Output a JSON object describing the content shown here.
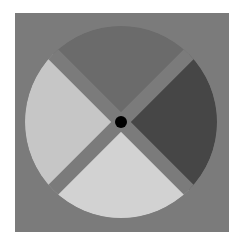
{
  "diagram": {
    "type": "four-quadrant wheel",
    "background_color": "#7b7b7b",
    "center_dot_color": "#000000",
    "sectors": [
      {
        "position": "top",
        "color": "#6b6b6b"
      },
      {
        "position": "right",
        "color": "#464646"
      },
      {
        "position": "bottom",
        "color": "#d2d2d2"
      },
      {
        "position": "left",
        "color": "#c6c6c6"
      }
    ],
    "divider_color": "#7b7b7b"
  }
}
